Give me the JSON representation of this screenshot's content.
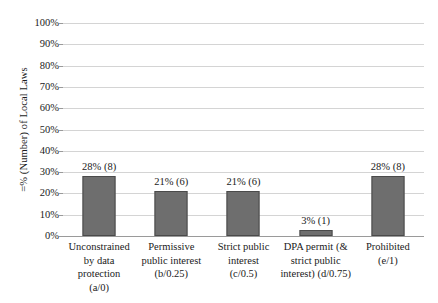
{
  "chart_data": {
    "type": "bar",
    "title": "",
    "xlabel": "",
    "ylabel": "=% (Number) of Local Laws",
    "ylim": [
      0,
      100
    ],
    "grid": true,
    "legend": "none",
    "categories": [
      "Unconstrained\nby data\nprotection\n(a/0)",
      "Permissive\npublic interest\n(b/0.25)",
      "Strict public\ninterest\n(c/0.5)",
      "DPA permit (&\nstrict public\ninterest) (d/0.75)",
      "Prohibited\n(e/1)"
    ],
    "values": [
      28,
      21,
      21,
      3,
      28
    ],
    "counts": [
      8,
      6,
      6,
      1,
      8
    ],
    "data_labels": [
      "28% (8)",
      "21% (6)",
      "21% (6)",
      "3% (1)",
      "28% (8)"
    ],
    "y_ticks": [
      "0%",
      "10%",
      "20%",
      "30%",
      "40%",
      "50%",
      "60%",
      "70%",
      "80%",
      "90%",
      "100%"
    ],
    "y_tick_values": [
      0,
      10,
      20,
      30,
      40,
      50,
      60,
      70,
      80,
      90,
      100
    ],
    "colors": {
      "bar_fill": "#6e6e6e",
      "bar_stroke": "#4a4a4a",
      "gridline": "#d4d4d4",
      "axis": "#9a9a9a",
      "text": "#1a1a1a",
      "background": "#ffffff"
    }
  }
}
